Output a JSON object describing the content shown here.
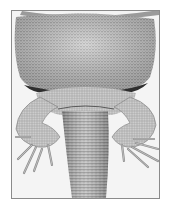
{
  "image": {
    "subject": "lizard underside",
    "description": "Grayscale photograph of a lizard's ventral side showing the scaly belly, both hind legs with spread toes, and the base of the tail, inside a thin gray frame on white background",
    "palette": {
      "background": "#ffffff",
      "frame_border": "#8a8a8a",
      "photo_background": "#f4f4f4",
      "skin_light": "#cfcfcf",
      "skin_mid": "#a8a8a8",
      "skin_dark": "#6e6e6e",
      "shadow": "#3a3a3a"
    }
  }
}
